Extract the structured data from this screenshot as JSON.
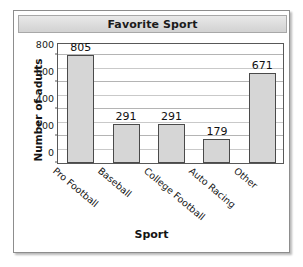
{
  "card": {
    "title": "Favorite Sport"
  },
  "chart_data": {
    "type": "bar",
    "title": "Favorite Sport",
    "xlabel": "Sport",
    "ylabel": "Number of adults",
    "categories": [
      "Pro Football",
      "Baseball",
      "College Football",
      "Auto Racing",
      "Other"
    ],
    "values": [
      805,
      291,
      291,
      179,
      671
    ],
    "value_labels": [
      "805",
      "291",
      "291",
      "179",
      "671"
    ],
    "ylim": [
      0,
      900
    ],
    "ytick_values": [
      0,
      200,
      400,
      600,
      800
    ],
    "ytick_labels": [
      "0",
      "200",
      "400",
      "600",
      "800"
    ],
    "minor_gridline_step": 100,
    "grid": true,
    "grid_axis": "y",
    "legend": false,
    "bar_fill": "#d6d6d6",
    "bar_edge": "#4a4a4a",
    "label_rotation_deg": 40
  }
}
